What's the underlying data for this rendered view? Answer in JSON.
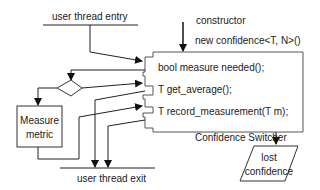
{
  "diagram": {
    "entry_label": "user thread entry",
    "exit_label": "user thread exit",
    "constructor": {
      "label": "constructor",
      "call": "new confidence<T, N>()"
    },
    "component": {
      "name": "Confidence Switcher",
      "methods": [
        "bool measure needed();",
        "T get_average();",
        "T record_measurement(T m);"
      ]
    },
    "measure_box": {
      "line1": "Measure",
      "line2": "metric"
    },
    "lost_confidence": {
      "line1": "lost",
      "line2": "confidence"
    },
    "colors": {
      "stroke": "#222222",
      "background": "#ffffff"
    }
  }
}
